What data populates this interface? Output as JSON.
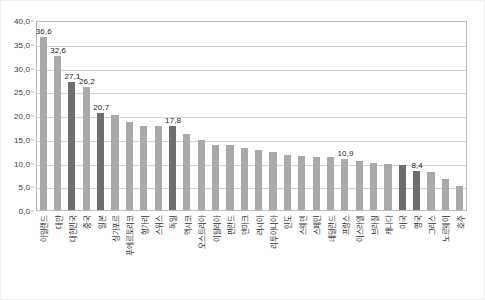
{
  "chart_data": {
    "type": "bar",
    "title": "",
    "subtitle": "",
    "xlabel": "",
    "ylabel": "",
    "ylim": [
      0.0,
      40.0
    ],
    "ytick_step": 5.0,
    "ytick_labels": [
      "40,0",
      "35,0",
      "30,0",
      "25,0",
      "20,0",
      "15,0",
      "10,0",
      "5,0",
      "0,0"
    ],
    "ytick_values": [
      40.0,
      35.0,
      30.0,
      25.0,
      20.0,
      15.0,
      10.0,
      5.0,
      0.0
    ],
    "grid": true,
    "grid_axis": "y",
    "legend": false,
    "legend_position": "none",
    "decimal_separator": ",",
    "categories": [
      "아일랜드",
      "대만",
      "대한민국",
      "중국",
      "일본",
      "싱가포르",
      "푸에르토리코",
      "헝가리",
      "스위스",
      "독일",
      "멕시코",
      "오스트리아",
      "이탈리아",
      "핀란드",
      "덴마크",
      "러시아",
      "리투아니아",
      "인도",
      "스웨덴",
      "스페인",
      "네덜란드",
      "프랑스",
      "이스라엘",
      "브라질",
      "캐나다",
      "미국",
      "영국",
      "그리스",
      "노르웨이",
      "호주"
    ],
    "values": [
      36.6,
      32.6,
      27.1,
      26.2,
      20.7,
      20.3,
      18.7,
      17.8,
      17.8,
      17.8,
      16.2,
      14.9,
      13.9,
      13.8,
      13.2,
      12.9,
      12.5,
      11.8,
      11.5,
      11.4,
      11.4,
      10.9,
      10.5,
      10.2,
      9.9,
      9.6,
      8.4,
      8.2,
      6.7,
      5.3
    ],
    "value_labels_shown": [
      {
        "index": 0,
        "label": "36,6"
      },
      {
        "index": 1,
        "label": "32,6"
      },
      {
        "index": 2,
        "label": "27,1"
      },
      {
        "index": 3,
        "label": "26,2"
      },
      {
        "index": 4,
        "label": "20,7"
      },
      {
        "index": 9,
        "label": "17,8"
      },
      {
        "index": 21,
        "label": "10,9"
      },
      {
        "index": 26,
        "label": "8,4"
      }
    ],
    "highlighted_indices": [
      2,
      4,
      9,
      25,
      26
    ],
    "colors": {
      "bar_default": "#a9a9a9",
      "bar_highlight": "#6e6e6e",
      "gridline": "#d2d2d2",
      "axis": "#bdbdbd",
      "text": "#2e2e2e",
      "background": "#ffffff"
    }
  }
}
